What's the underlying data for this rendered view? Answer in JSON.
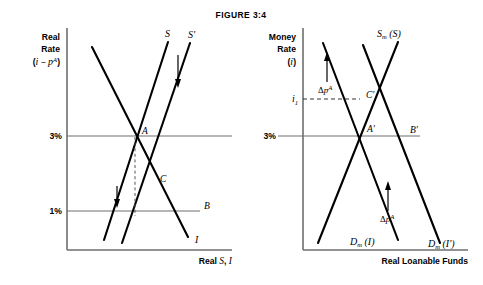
{
  "figure": {
    "title": "FIGURE 3:4",
    "background_color": "#ffffff",
    "line_color": "#000000",
    "axis_color": "#6e6e6e"
  },
  "left_panel": {
    "y_axis_caption_lines": [
      "Real",
      "Rate"
    ],
    "y_axis_caption_expr_open": "(",
    "y_axis_caption_expr_i": "i",
    "y_axis_caption_expr_minus": " − ",
    "y_axis_caption_expr_p": "p",
    "y_axis_caption_expr_sup": "A",
    "y_axis_caption_expr_close": ")",
    "x_axis_label_prefix": "Real ",
    "x_axis_label_s": "S",
    "x_axis_label_sep": ", ",
    "x_axis_label_i": "I",
    "ticks": [
      {
        "label": "3%",
        "value": 3
      },
      {
        "label": "1%",
        "value": 1
      }
    ],
    "curves": [
      {
        "name": "supply-original",
        "label": "S"
      },
      {
        "name": "supply-shifted",
        "label": "S'"
      },
      {
        "name": "investment-demand",
        "label": "I"
      }
    ],
    "points": [
      {
        "label": "A",
        "rate": 3
      },
      {
        "label": "B",
        "rate": 1
      },
      {
        "label": "C",
        "rate": 2
      }
    ],
    "shift_arrow_direction": "down",
    "shift_arrow_count": 2
  },
  "right_panel": {
    "y_axis_caption_lines": [
      "Money",
      "Rate"
    ],
    "y_axis_caption_expr_open": "(",
    "y_axis_caption_expr_i": "i",
    "y_axis_caption_expr_close": ")",
    "x_axis_label": "Real Loanable Funds",
    "ticks": [
      {
        "label": "3%",
        "value": 3
      },
      {
        "label": "i",
        "sub": "1",
        "value": 5
      }
    ],
    "curves": [
      {
        "name": "money-supply",
        "label_main": "S",
        "label_sub": "m",
        "label_paren": " (S)"
      },
      {
        "name": "money-demand-original",
        "label_main": "D",
        "label_sub": "m",
        "label_paren": " (I)"
      },
      {
        "name": "money-demand-shifted",
        "label_main": "D",
        "label_sub": "m",
        "label_paren": " (I')"
      }
    ],
    "points": [
      {
        "label": "A'",
        "rate": 3
      },
      {
        "label": "B'",
        "rate": 3
      },
      {
        "label": "C'",
        "rate": 5
      }
    ],
    "annotations": [
      {
        "name": "delta-p-upper",
        "symbol": "Δ",
        "var": "p",
        "sup": "A",
        "arrow": "up"
      },
      {
        "name": "delta-p-lower",
        "symbol": "Δ",
        "var": "p",
        "sup": "A",
        "arrow": "up"
      }
    ],
    "dashed_guide": {
      "from_tick": "i1",
      "to_point": "C'"
    }
  }
}
